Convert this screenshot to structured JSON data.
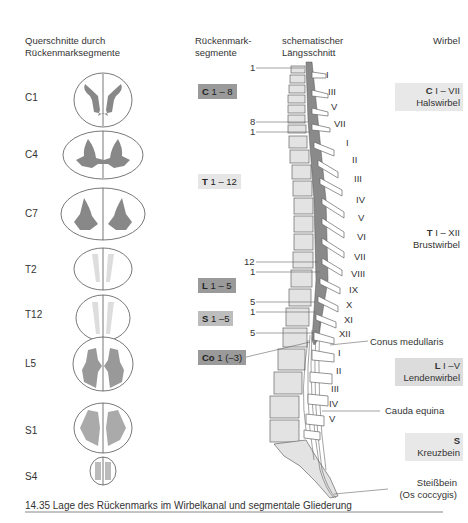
{
  "headers": {
    "cross_sections": [
      "Querschnitte durch",
      "Rückenmarksegmente"
    ],
    "segments": [
      "Rückenmark-",
      "segmente"
    ],
    "longitudinal": [
      "schematischer",
      "Längsschnitt"
    ],
    "vertebrae": "Wirbel"
  },
  "cross_sections": [
    {
      "label": "C1"
    },
    {
      "label": "C4"
    },
    {
      "label": "C7"
    },
    {
      "label": "T2"
    },
    {
      "label": "T12"
    },
    {
      "label": "L5"
    },
    {
      "label": "S1"
    },
    {
      "label": "S4"
    }
  ],
  "segment_boxes": [
    {
      "letter": "C",
      "range": "1 – 8",
      "color": "#9a9a9a"
    },
    {
      "letter": "T",
      "range": "1 – 12",
      "color": "#e6e6e6"
    },
    {
      "letter": "L",
      "range": "1 – 5",
      "color": "#9a9a9a"
    },
    {
      "letter": "S",
      "range": "1 –5",
      "color": "#bdbdbd"
    },
    {
      "letter": "Co",
      "range": "1 (–3)",
      "color": "#9a9a9a"
    }
  ],
  "segment_numbers": [
    "1",
    "8",
    "1",
    "12",
    "1",
    "5",
    "1",
    "5"
  ],
  "vertebra_numerals": {
    "cervical": [
      "I",
      "III",
      "V",
      "VII"
    ],
    "thoracic": [
      "I",
      "II",
      "III",
      "IV",
      "V",
      "VI",
      "VII",
      "VIII",
      "IX",
      "X",
      "XI",
      "XII"
    ],
    "lumbar": [
      "I",
      "II",
      "III",
      "IV",
      "V"
    ]
  },
  "vertebra_boxes": [
    {
      "letter": "C",
      "range": "I – VII",
      "name": "Halswirbel"
    },
    {
      "letter": "T",
      "range": "I – XII",
      "name": "Brustwirbel"
    },
    {
      "letter": "L",
      "range": "I –V",
      "name": "Lendenwirbel"
    },
    {
      "letter": "S",
      "range": "",
      "name": "Kreuzbein"
    }
  ],
  "annotations": {
    "conus": "Conus medullaris",
    "cauda": "Cauda equina",
    "coccyx_1": "Steißbein",
    "coccyx_2": "(Os coccygis)"
  },
  "caption": "14.35 Lage des Rückenmarks im Wirbelkanal und segmentale Gliederung"
}
